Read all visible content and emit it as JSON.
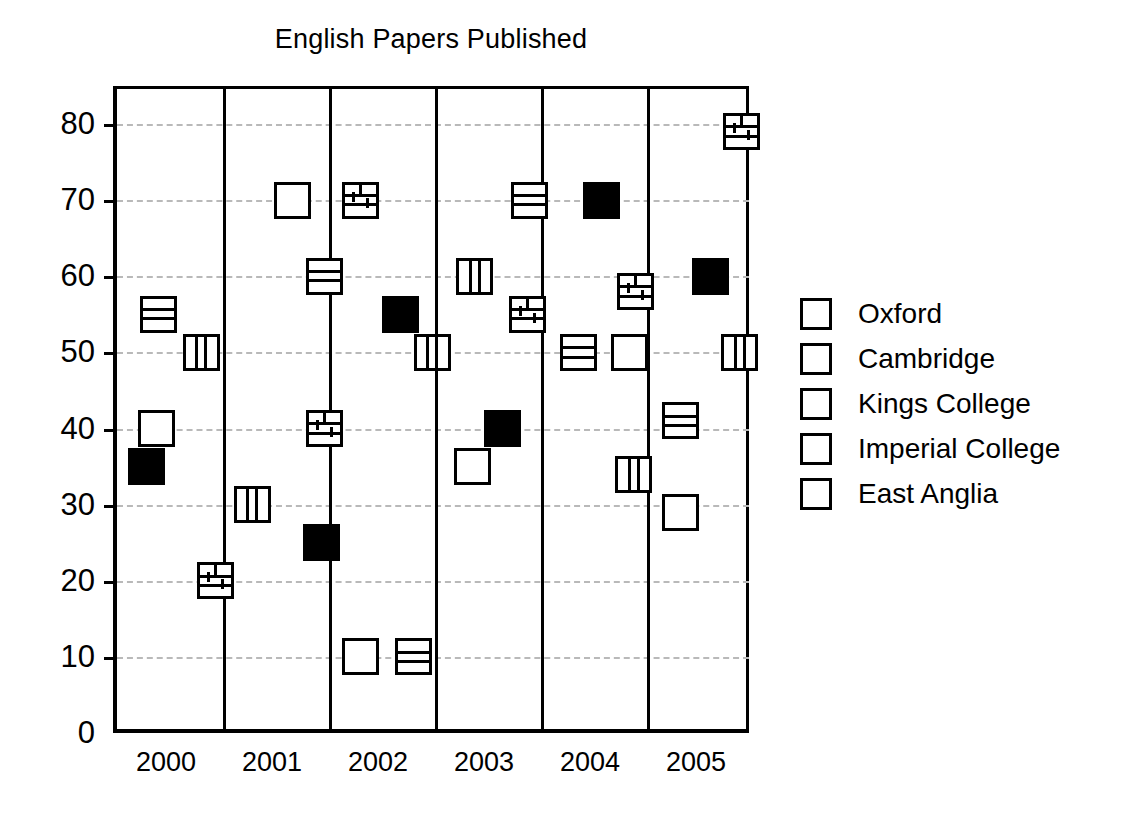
{
  "chart_data": {
    "type": "scatter",
    "title": "English Papers Published",
    "xlabel": "",
    "ylabel": "",
    "categories": [
      "2000",
      "2001",
      "2002",
      "2003",
      "2004",
      "2005"
    ],
    "ylim": [
      0,
      85
    ],
    "yticks": [
      0,
      10,
      20,
      30,
      40,
      50,
      60,
      70,
      80
    ],
    "ytick_labels": [
      "0",
      "10",
      "20",
      "30",
      "40",
      "50",
      "60",
      "70",
      "80"
    ],
    "grid": true,
    "legend_position": "right",
    "series": [
      {
        "name": "Oxford",
        "marker": "solid-black-square",
        "values": [
          35,
          25,
          55,
          40,
          70,
          60
        ]
      },
      {
        "name": "Cambridge",
        "marker": "empty-white-square",
        "values": [
          40,
          70,
          10,
          35,
          50,
          29
        ]
      },
      {
        "name": "Kings College",
        "marker": "brick-pattern-square",
        "values": [
          20,
          40,
          70,
          55,
          58,
          79
        ]
      },
      {
        "name": "Imperial College",
        "marker": "vertical-stripe-square",
        "values": [
          50,
          30,
          50,
          60,
          34,
          50
        ]
      },
      {
        "name": "East Anglia",
        "marker": "horizontal-stripe-square",
        "values": [
          55,
          60,
          10,
          70,
          50,
          41
        ]
      }
    ],
    "points": [
      {
        "year": "2000",
        "series": "East Anglia",
        "value": 55,
        "x_offset": 0.22
      },
      {
        "year": "2000",
        "series": "Imperial College",
        "value": 50,
        "x_offset": 0.62
      },
      {
        "year": "2000",
        "series": "Cambridge",
        "value": 40,
        "x_offset": 0.2
      },
      {
        "year": "2000",
        "series": "Oxford",
        "value": 35,
        "x_offset": 0.1
      },
      {
        "year": "2000",
        "series": "Kings College",
        "value": 20,
        "x_offset": 0.75
      },
      {
        "year": "2001",
        "series": "Cambridge",
        "value": 70,
        "x_offset": 0.48
      },
      {
        "year": "2001",
        "series": "East Anglia",
        "value": 60,
        "x_offset": 0.78
      },
      {
        "year": "2001",
        "series": "Kings College",
        "value": 40,
        "x_offset": 0.78
      },
      {
        "year": "2001",
        "series": "Imperial College",
        "value": 30,
        "x_offset": 0.1
      },
      {
        "year": "2001",
        "series": "Oxford",
        "value": 25,
        "x_offset": 0.75
      },
      {
        "year": "2002",
        "series": "Kings College",
        "value": 70,
        "x_offset": 0.12
      },
      {
        "year": "2002",
        "series": "Oxford",
        "value": 55,
        "x_offset": 0.5
      },
      {
        "year": "2002",
        "series": "Imperial College",
        "value": 50,
        "x_offset": 0.8
      },
      {
        "year": "2002",
        "series": "Cambridge",
        "value": 10,
        "x_offset": 0.12
      },
      {
        "year": "2002",
        "series": "East Anglia",
        "value": 10,
        "x_offset": 0.62
      },
      {
        "year": "2003",
        "series": "East Anglia",
        "value": 70,
        "x_offset": 0.72
      },
      {
        "year": "2003",
        "series": "Imperial College",
        "value": 60,
        "x_offset": 0.2
      },
      {
        "year": "2003",
        "series": "Kings College",
        "value": 55,
        "x_offset": 0.7
      },
      {
        "year": "2003",
        "series": "Oxford",
        "value": 40,
        "x_offset": 0.46
      },
      {
        "year": "2003",
        "series": "Cambridge",
        "value": 35,
        "x_offset": 0.18
      },
      {
        "year": "2004",
        "series": "Oxford",
        "value": 70,
        "x_offset": 0.4
      },
      {
        "year": "2004",
        "series": "Kings College",
        "value": 58,
        "x_offset": 0.72
      },
      {
        "year": "2004",
        "series": "East Anglia",
        "value": 50,
        "x_offset": 0.18
      },
      {
        "year": "2004",
        "series": "Cambridge",
        "value": 50,
        "x_offset": 0.66
      },
      {
        "year": "2004",
        "series": "Imperial College",
        "value": 34,
        "x_offset": 0.7
      },
      {
        "year": "2005",
        "series": "Kings College",
        "value": 79,
        "x_offset": 0.72
      },
      {
        "year": "2005",
        "series": "Oxford",
        "value": 60,
        "x_offset": 0.42
      },
      {
        "year": "2005",
        "series": "Imperial College",
        "value": 50,
        "x_offset": 0.7
      },
      {
        "year": "2005",
        "series": "East Anglia",
        "value": 41,
        "x_offset": 0.14
      },
      {
        "year": "2005",
        "series": "Cambridge",
        "value": 29,
        "x_offset": 0.14
      }
    ]
  },
  "legend": {
    "items": [
      {
        "label": "Oxford",
        "marker": "solid-black-square"
      },
      {
        "label": "Cambridge",
        "marker": "empty-white-square"
      },
      {
        "label": "Kings College",
        "marker": "brick-pattern-square"
      },
      {
        "label": "Imperial College",
        "marker": "vertical-stripe-square"
      },
      {
        "label": "East Anglia",
        "marker": "horizontal-stripe-square"
      }
    ]
  },
  "colors": {
    "foreground": "#000000",
    "background": "#ffffff",
    "gridline": "#b9b9b9"
  }
}
